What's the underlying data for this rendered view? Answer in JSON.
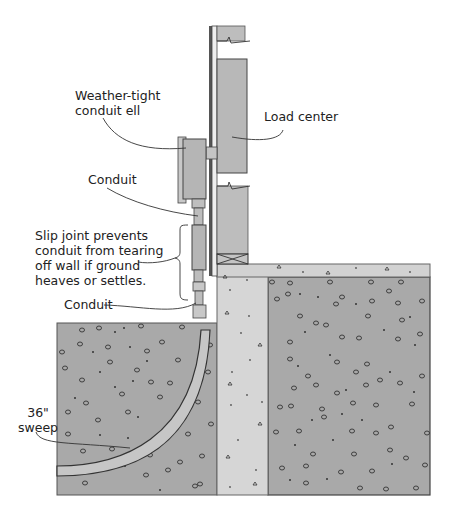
{
  "labels": {
    "weather_tight": "Weather-tight\nconduit ell",
    "load_center": "Load center",
    "conduit_upper": "Conduit",
    "slip_joint": "Slip joint prevents\nconduit from tearing\noff wall if ground\nheaves or settles.",
    "conduit_lower": "Conduit",
    "sweep": "36\"\nsweep"
  },
  "colors": {
    "soil": "#a9a9a9",
    "foundation": "#d4d4d4",
    "slab": "#d0d0d0",
    "panel": "#b8b8b8",
    "outline": "#333333"
  }
}
